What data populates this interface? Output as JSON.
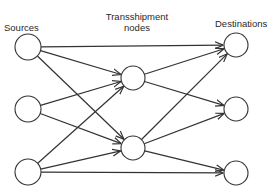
{
  "labels": {
    "sources": "Sources",
    "transshipment_line1": "Transshipment",
    "transshipment_line2": "nodes",
    "destinations": "Destinations"
  },
  "colors": {
    "stroke": "#333333",
    "node_fill": "#ffffff",
    "background": "#ffffff"
  },
  "nodes": [
    {
      "id": "S1",
      "group": "source",
      "cx": 28,
      "cy": 47,
      "r": 13
    },
    {
      "id": "S2",
      "group": "source",
      "cx": 28,
      "cy": 109,
      "r": 13
    },
    {
      "id": "S3",
      "group": "source",
      "cx": 28,
      "cy": 172,
      "r": 13
    },
    {
      "id": "T1",
      "group": "transshipment",
      "cx": 133,
      "cy": 78,
      "r": 12
    },
    {
      "id": "T2",
      "group": "transshipment",
      "cx": 133,
      "cy": 148,
      "r": 12
    },
    {
      "id": "D1",
      "group": "destination",
      "cx": 236,
      "cy": 45,
      "r": 12
    },
    {
      "id": "D2",
      "group": "destination",
      "cx": 236,
      "cy": 109,
      "r": 12
    },
    {
      "id": "D3",
      "group": "destination",
      "cx": 236,
      "cy": 173,
      "r": 12
    }
  ],
  "edges": [
    {
      "from": "S1",
      "to": "D1"
    },
    {
      "from": "S1",
      "to": "T1"
    },
    {
      "from": "S1",
      "to": "T2"
    },
    {
      "from": "S2",
      "to": "T1"
    },
    {
      "from": "S2",
      "to": "T2"
    },
    {
      "from": "S3",
      "to": "T1"
    },
    {
      "from": "S3",
      "to": "T2"
    },
    {
      "from": "S3",
      "to": "D3"
    },
    {
      "from": "T1",
      "to": "D1"
    },
    {
      "from": "T1",
      "to": "D2"
    },
    {
      "from": "T2",
      "to": "D1"
    },
    {
      "from": "T2",
      "to": "D2"
    },
    {
      "from": "T2",
      "to": "D3"
    }
  ]
}
